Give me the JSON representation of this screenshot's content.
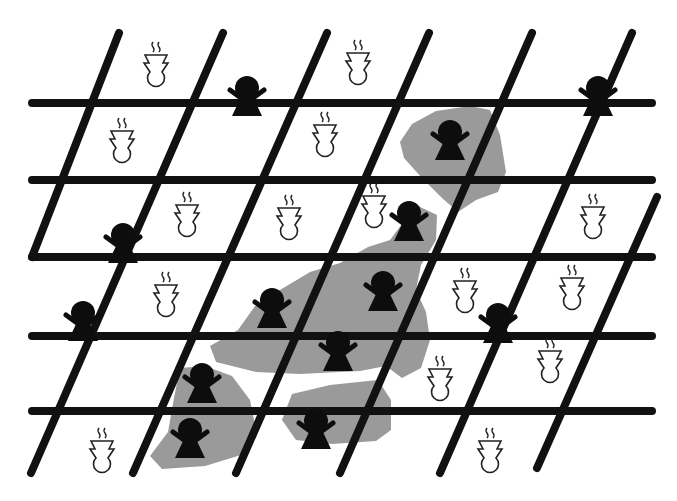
{
  "diagram": {
    "colors": {
      "background": "#ffffff",
      "line": "#111111",
      "blob": "#9a9a9a",
      "black_figure": "#0d0d0d",
      "white_figure_fill": "#ffffff",
      "white_figure_stroke": "#222222"
    },
    "horizontal_lines": [
      {
        "x1": 32,
        "y1": 103,
        "x2": 652,
        "y2": 103
      },
      {
        "x1": 32,
        "y1": 180,
        "x2": 652,
        "y2": 180
      },
      {
        "x1": 32,
        "y1": 257,
        "x2": 652,
        "y2": 257
      },
      {
        "x1": 32,
        "y1": 336,
        "x2": 652,
        "y2": 336
      },
      {
        "x1": 32,
        "y1": 411,
        "x2": 652,
        "y2": 411
      }
    ],
    "diagonal_lines": [
      {
        "x1": 119,
        "y1": 33,
        "x2": 32,
        "y2": 257
      },
      {
        "x1": 223,
        "y1": 33,
        "x2": 31,
        "y2": 473
      },
      {
        "x1": 327,
        "y1": 33,
        "x2": 133,
        "y2": 473
      },
      {
        "x1": 429,
        "y1": 33,
        "x2": 236,
        "y2": 473
      },
      {
        "x1": 532,
        "y1": 33,
        "x2": 340,
        "y2": 473
      },
      {
        "x1": 632,
        "y1": 33,
        "x2": 440,
        "y2": 473
      },
      {
        "x1": 657,
        "y1": 197,
        "x2": 537,
        "y2": 468
      }
    ],
    "shaded_regions": [
      {
        "name": "top-right-cluster",
        "points": "400,142 412,124 436,111 470,106 490,110 500,135 506,172 498,192 476,200 458,212 442,198 422,178 404,158"
      },
      {
        "name": "central-cluster",
        "points": "418,206 437,215 436,240 421,265 416,290 426,312 430,340 421,368 402,378 386,366 360,371 300,374 256,372 216,362 210,346 238,330 255,306 280,290 310,272 340,263 368,247 390,240 402,224"
      },
      {
        "name": "lower-left-cluster",
        "points": "180,368 205,366 232,376 250,400 256,430 241,455 205,466 162,469 150,456 168,432 174,398"
      },
      {
        "name": "lower-middle-cluster",
        "points": "292,394 330,385 378,380 391,400 391,430 376,441 332,444 296,440 282,420"
      }
    ],
    "black_figures": [
      {
        "x": 247,
        "y": 88,
        "location": "grid"
      },
      {
        "x": 598,
        "y": 88,
        "location": "grid"
      },
      {
        "x": 123,
        "y": 235,
        "location": "grid"
      },
      {
        "x": 83,
        "y": 313,
        "location": "grid"
      },
      {
        "x": 498,
        "y": 315,
        "location": "grid"
      },
      {
        "x": 450,
        "y": 132,
        "location": "cluster"
      },
      {
        "x": 409,
        "y": 213,
        "location": "cluster"
      },
      {
        "x": 272,
        "y": 300,
        "location": "cluster"
      },
      {
        "x": 383,
        "y": 283,
        "location": "cluster"
      },
      {
        "x": 338,
        "y": 343,
        "location": "cluster"
      },
      {
        "x": 202,
        "y": 375,
        "location": "cluster"
      },
      {
        "x": 190,
        "y": 430,
        "location": "cluster"
      },
      {
        "x": 316,
        "y": 421,
        "location": "cluster"
      }
    ],
    "white_figures": [
      {
        "x": 156,
        "y": 42
      },
      {
        "x": 358,
        "y": 40
      },
      {
        "x": 122,
        "y": 118
      },
      {
        "x": 325,
        "y": 112
      },
      {
        "x": 187,
        "y": 192
      },
      {
        "x": 289,
        "y": 195
      },
      {
        "x": 374,
        "y": 183
      },
      {
        "x": 593,
        "y": 194
      },
      {
        "x": 166,
        "y": 272
      },
      {
        "x": 465,
        "y": 268
      },
      {
        "x": 572,
        "y": 265
      },
      {
        "x": 550,
        "y": 338
      },
      {
        "x": 440,
        "y": 356
      },
      {
        "x": 102,
        "y": 428
      },
      {
        "x": 490,
        "y": 428
      }
    ],
    "legend_icons": {
      "black_figure": "person-icon",
      "white_figure": "steaming-cup-icon"
    }
  }
}
